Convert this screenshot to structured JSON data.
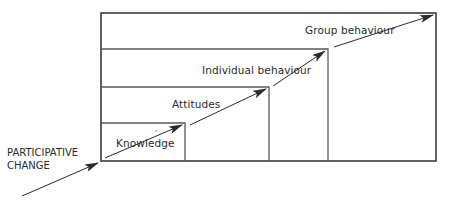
{
  "diagram": {
    "type": "staircase-nested-boxes",
    "entry_label_line1": "PARTICIPATIVE",
    "entry_label_line2": "CHANGE",
    "stages": [
      {
        "id": "knowledge",
        "label": "Knowledge",
        "order": 1
      },
      {
        "id": "attitudes",
        "label": "Attitudes",
        "order": 2
      },
      {
        "id": "individual-behaviour",
        "label": "Individual behaviour",
        "order": 3
      },
      {
        "id": "group-behaviour",
        "label": "Group behaviour",
        "order": 4
      }
    ],
    "colors": {
      "line": "#3a3a3a",
      "text": "#2a2a2a",
      "background": "#ffffff"
    }
  }
}
